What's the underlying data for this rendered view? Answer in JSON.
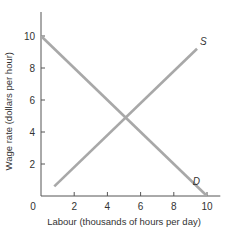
{
  "chart_data": {
    "type": "line",
    "title": "",
    "xlabel": "Labour (thousands of hours per day)",
    "ylabel": "Wage rate (dollars per hour)",
    "xlim": [
      0,
      10.5
    ],
    "ylim": [
      0,
      11.5
    ],
    "x_ticks": [
      0,
      2,
      4,
      6,
      8,
      10
    ],
    "y_ticks": [
      2,
      4,
      6,
      8,
      10
    ],
    "origin_label": "0",
    "grid": false,
    "series": [
      {
        "name": "S",
        "label": "S",
        "color": "#a8a8a8",
        "points": [
          [
            0.8,
            0.6
          ],
          [
            9.4,
            9.2
          ]
        ]
      },
      {
        "name": "D",
        "label": "D",
        "color": "#a8a8a8",
        "points": [
          [
            0,
            10
          ],
          [
            10,
            0
          ]
        ]
      }
    ]
  }
}
